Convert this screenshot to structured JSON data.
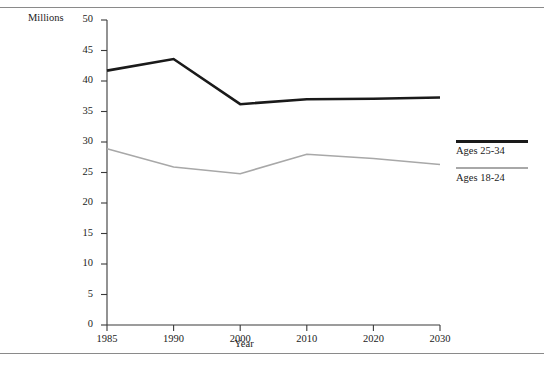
{
  "chart_data": {
    "type": "line",
    "title": "",
    "xlabel": "Year",
    "ylabel": "Millions",
    "x": [
      1985,
      1990,
      2000,
      2010,
      2020,
      2030
    ],
    "categories": [
      "1985",
      "1990",
      "2000",
      "2010",
      "2020",
      "2030"
    ],
    "series": [
      {
        "name": "Ages 25-34",
        "color": "#1a1a1a",
        "width": 2.6,
        "values": [
          41.7,
          43.6,
          36.2,
          37.0,
          37.1,
          37.3
        ]
      },
      {
        "name": "Ages 18-24",
        "color": "#a8a8a8",
        "width": 1.6,
        "values": [
          28.9,
          25.9,
          24.8,
          28.0,
          27.3,
          26.3
        ]
      }
    ],
    "ylim": [
      0,
      50
    ],
    "ytick_step": 5,
    "yticks": [
      "0",
      "5",
      "10",
      "15",
      "20",
      "25",
      "30",
      "35",
      "40",
      "45",
      "50"
    ],
    "grid": false,
    "legend_position": "right"
  },
  "legend": {
    "entries": [
      {
        "label": "Ages 25-34"
      },
      {
        "label": "Ages 18-24"
      }
    ]
  },
  "axes": {
    "y_unit_label": "Millions",
    "x_title": "Year"
  }
}
